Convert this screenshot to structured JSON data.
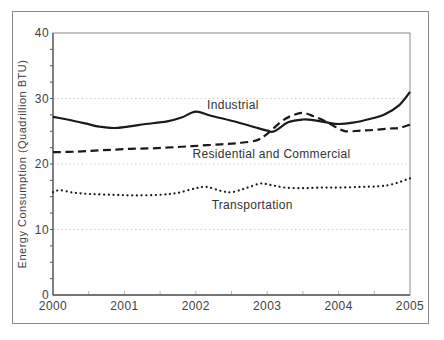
{
  "palette": {
    "background": "#ffffff",
    "figure_border": "#8c8c8c",
    "plot_border": "#8c8c8c",
    "axis": "#5a5a5a",
    "gridline": "#cccccc",
    "minor_tick_x": "#b5b5b5",
    "minor_tick_y": "#555555",
    "text": "#3f3f3f",
    "line": "#1a1a1a"
  },
  "chart_data": {
    "type": "line",
    "title": "",
    "xlabel": "",
    "ylabel": "Energy Consumption (Quadrillion BTU)",
    "xlim": [
      2000,
      2005
    ],
    "ylim": [
      0,
      40
    ],
    "x_ticks": [
      2000,
      2001,
      2002,
      2003,
      2004,
      2005
    ],
    "y_ticks": [
      0,
      10,
      20,
      30,
      40
    ],
    "y_grid_values": [
      10,
      20,
      30
    ],
    "x_minor_tick_step": 0.5,
    "y_minor_tick_step": 2.5,
    "grid": "horizontal dotted light gray",
    "legend": "inline labels next to lines",
    "series": [
      {
        "name": "Industrial",
        "style": "solid",
        "label_anchor": {
          "year": 2002.52,
          "value": 29.0
        },
        "points": [
          [
            2000.0,
            27.2
          ],
          [
            2000.2,
            26.8
          ],
          [
            2000.45,
            26.2
          ],
          [
            2000.65,
            25.7
          ],
          [
            2000.85,
            25.5
          ],
          [
            2001.05,
            25.7
          ],
          [
            2001.3,
            26.1
          ],
          [
            2001.6,
            26.5
          ],
          [
            2001.8,
            27.1
          ],
          [
            2002.0,
            28.0
          ],
          [
            2002.2,
            27.4
          ],
          [
            2002.5,
            26.6
          ],
          [
            2002.8,
            25.7
          ],
          [
            2003.0,
            25.1
          ],
          [
            2003.1,
            25.0
          ],
          [
            2003.3,
            26.4
          ],
          [
            2003.5,
            26.8
          ],
          [
            2003.65,
            26.7
          ],
          [
            2003.85,
            26.3
          ],
          [
            2004.0,
            26.1
          ],
          [
            2004.2,
            26.3
          ],
          [
            2004.45,
            26.9
          ],
          [
            2004.65,
            27.6
          ],
          [
            2004.85,
            29.0
          ],
          [
            2005.0,
            31.0
          ]
        ]
      },
      {
        "name": "Residential and Commercial",
        "style": "dashed",
        "label_anchor": {
          "year": 2003.06,
          "value": 21.6
        },
        "points": [
          [
            2000.0,
            21.8
          ],
          [
            2000.35,
            21.9
          ],
          [
            2000.7,
            22.1
          ],
          [
            2001.05,
            22.3
          ],
          [
            2001.4,
            22.4
          ],
          [
            2001.75,
            22.6
          ],
          [
            2002.05,
            22.8
          ],
          [
            2002.35,
            23.0
          ],
          [
            2002.6,
            23.2
          ],
          [
            2002.85,
            23.6
          ],
          [
            2003.0,
            24.6
          ],
          [
            2003.2,
            26.5
          ],
          [
            2003.35,
            27.4
          ],
          [
            2003.5,
            27.8
          ],
          [
            2003.65,
            27.3
          ],
          [
            2003.8,
            26.6
          ],
          [
            2003.95,
            25.7
          ],
          [
            2004.1,
            25.0
          ],
          [
            2004.3,
            25.1
          ],
          [
            2004.5,
            25.2
          ],
          [
            2004.7,
            25.4
          ],
          [
            2004.85,
            25.5
          ],
          [
            2005.0,
            26.0
          ]
        ]
      },
      {
        "name": "Transportation",
        "style": "dotted",
        "label_anchor": {
          "year": 2002.79,
          "value": 13.7
        },
        "points": [
          [
            2000.0,
            15.7
          ],
          [
            2000.1,
            16.0
          ],
          [
            2000.3,
            15.6
          ],
          [
            2000.55,
            15.4
          ],
          [
            2000.85,
            15.3
          ],
          [
            2001.15,
            15.2
          ],
          [
            2001.5,
            15.3
          ],
          [
            2001.75,
            15.6
          ],
          [
            2002.0,
            16.3
          ],
          [
            2002.15,
            16.5
          ],
          [
            2002.35,
            15.9
          ],
          [
            2002.5,
            15.7
          ],
          [
            2002.7,
            16.3
          ],
          [
            2002.9,
            17.0
          ],
          [
            2003.05,
            16.8
          ],
          [
            2003.25,
            16.4
          ],
          [
            2003.5,
            16.3
          ],
          [
            2003.75,
            16.4
          ],
          [
            2004.0,
            16.4
          ],
          [
            2004.3,
            16.5
          ],
          [
            2004.55,
            16.6
          ],
          [
            2004.75,
            16.9
          ],
          [
            2005.0,
            17.8
          ]
        ]
      }
    ]
  }
}
